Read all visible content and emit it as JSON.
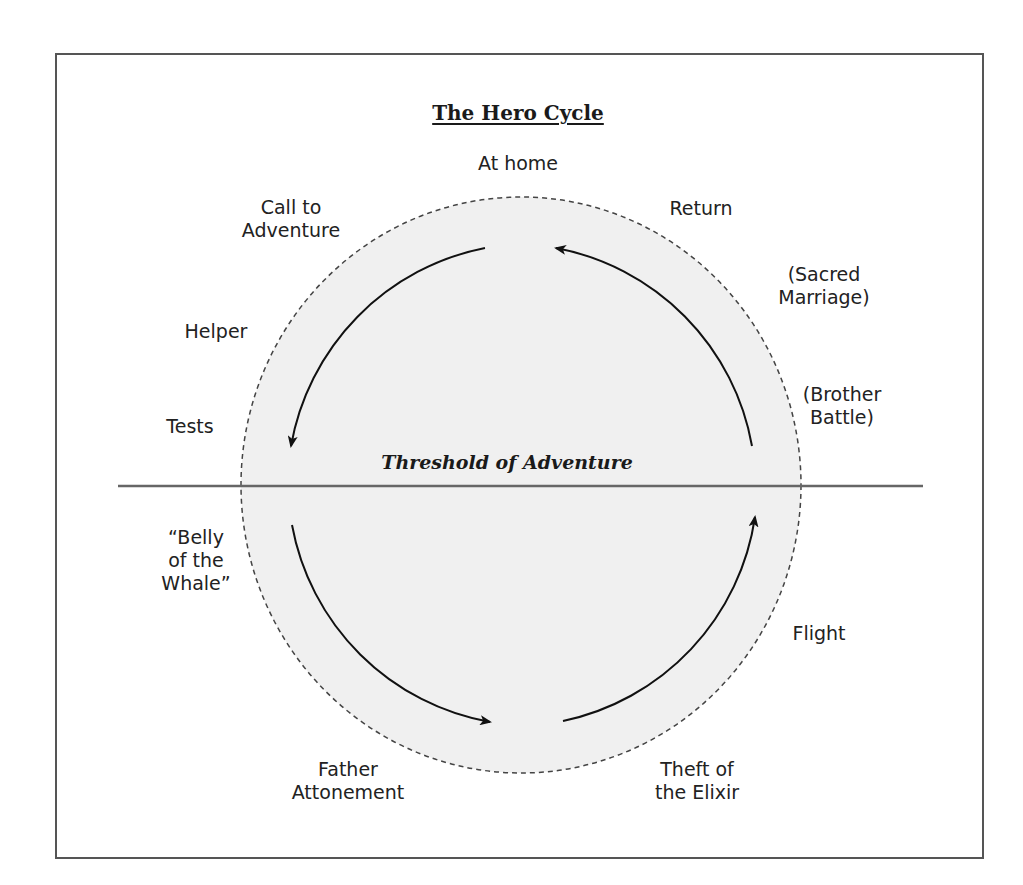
{
  "diagram": {
    "title": "The Hero Cycle",
    "threshold_label": "Threshold of Adventure",
    "colors": {
      "circle_fill": "#f0f0f0",
      "circle_border": "#444444",
      "threshold_line": "#666666",
      "arrow": "#111111",
      "frame_border": "#555555"
    },
    "stages": {
      "at_home": "At home",
      "call_to_adventure": [
        "Call to",
        "Adventure"
      ],
      "helper": "Helper",
      "tests": "Tests",
      "belly_of_the_whale": [
        "“Belly",
        "of the",
        "Whale”"
      ],
      "father_attonement": [
        "Father",
        "Attonement"
      ],
      "theft_of_the_elixir": [
        "Theft of",
        "the Elixir"
      ],
      "flight": "Flight",
      "brother_battle": [
        "(Brother",
        "Battle)"
      ],
      "sacred_marriage": [
        "(Sacred",
        "Marriage)"
      ],
      "return": "Return"
    },
    "flow_direction": "counter-clockwise",
    "arrows": [
      {
        "from": "top",
        "to": "left-upper",
        "direction": "down"
      },
      {
        "from": "left-lower",
        "to": "bottom",
        "direction": "right"
      },
      {
        "from": "bottom",
        "to": "right-lower",
        "direction": "up"
      },
      {
        "from": "right-upper",
        "to": "top",
        "direction": "left"
      }
    ]
  }
}
